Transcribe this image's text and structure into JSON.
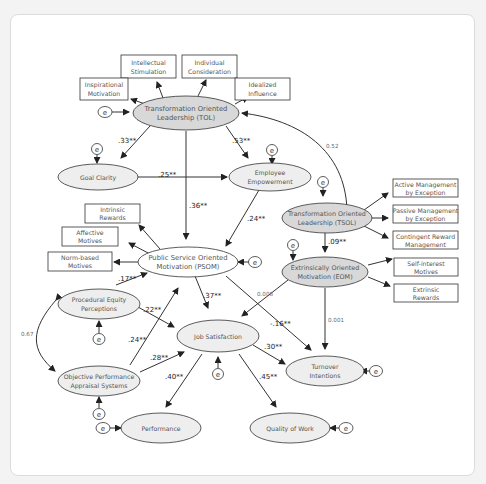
{
  "diagram": {
    "type": "structural-equation-model",
    "latent_nodes": [
      {
        "id": "TOL",
        "line1": "Transformation Oriented",
        "line2": "Leadership (TOL)",
        "shaded": true
      },
      {
        "id": "GC",
        "line1": "Goal Clarity",
        "line2": "",
        "shaded": false
      },
      {
        "id": "EE",
        "line1": "Employee",
        "line2": "Empowerment",
        "shaded": false
      },
      {
        "id": "TSOL",
        "line1": "Transformation Oriented",
        "line2": "Leadership (TSOL)",
        "shaded": true
      },
      {
        "id": "EOM",
        "line1": "Extrinsically Oriented",
        "line2": "Motivation (EOM)",
        "shaded": true
      },
      {
        "id": "PSOM",
        "line1": "Public Service Oriented",
        "line2": "Motivation (PSOM)",
        "shaded": false
      },
      {
        "id": "PEP",
        "line1": "Procedural Equity",
        "line2": "Perceptions",
        "shaded": false
      },
      {
        "id": "OPAS",
        "line1": "Objective Performance",
        "line2": "Appraisal Systems",
        "shaded": false
      },
      {
        "id": "JS",
        "line1": "Job Satisfaction",
        "line2": "",
        "shaded": false
      },
      {
        "id": "TI",
        "line1": "Turnover",
        "line2": "Intentions",
        "shaded": false
      },
      {
        "id": "PERF",
        "line1": "Performance",
        "line2": "",
        "shaded": false
      },
      {
        "id": "QW",
        "line1": "Quality of Work",
        "line2": "",
        "shaded": false
      }
    ],
    "indicators": [
      {
        "id": "intellectual",
        "line1": "Intellectual",
        "line2": "Stimulation"
      },
      {
        "id": "individual",
        "line1": "Individual",
        "line2": "Consideration"
      },
      {
        "id": "inspirational",
        "line1": "Inspirational",
        "line2": "Motivation"
      },
      {
        "id": "idealized",
        "line1": "Idealized",
        "line2": "Influence"
      },
      {
        "id": "active",
        "line1": "Active Management",
        "line2": "by Exception"
      },
      {
        "id": "passive",
        "line1": "Passive Management",
        "line2": "by Exception"
      },
      {
        "id": "contingent",
        "line1": "Contingent Reward",
        "line2": "Management"
      },
      {
        "id": "selfinterest",
        "line1": "Self-interest",
        "line2": "Motives"
      },
      {
        "id": "extrinsic",
        "line1": "Extrinsic",
        "line2": "Rewards"
      },
      {
        "id": "intrinsic",
        "line1": "Intrinsic",
        "line2": "Rewards"
      },
      {
        "id": "affective",
        "line1": "Affective",
        "line2": "Motives"
      },
      {
        "id": "normbased",
        "line1": "Norm-based",
        "line2": "Motives"
      }
    ],
    "error_label": "e",
    "paths": [
      {
        "from": "TOL",
        "to": "GC",
        "coef": ".33**"
      },
      {
        "from": "TOL",
        "to": "EE",
        "coef": ".53**"
      },
      {
        "from": "GC",
        "to": "EE",
        "coef": ".25**"
      },
      {
        "from": "TOL",
        "to": "PSOM",
        "coef": ".36**"
      },
      {
        "from": "EE",
        "to": "PSOM",
        "coef": ".24**"
      },
      {
        "from": "TSOL",
        "to": "EOM",
        "coef": ".09**"
      },
      {
        "from": "TSOL",
        "to": "TOL",
        "coef": "0.52"
      },
      {
        "from": "EOM",
        "to": "JS",
        "coef": "0.008"
      },
      {
        "from": "EOM",
        "to": "TI",
        "coef": "0.001"
      },
      {
        "from": "PEP",
        "to": "PSOM",
        "coef": ".17**"
      },
      {
        "from": "PEP",
        "to": "JS",
        "coef": ".22**"
      },
      {
        "from": "OPAS",
        "to": "PSOM",
        "coef": ".24**"
      },
      {
        "from": "OPAS",
        "to": "JS",
        "coef": ".28**"
      },
      {
        "from": "PSOM",
        "to": "JS",
        "coef": ".37**"
      },
      {
        "from": "PSOM",
        "to": "TI",
        "coef": "-.16**"
      },
      {
        "from": "JS",
        "to": "TI",
        "coef": ".30**"
      },
      {
        "from": "JS",
        "to": "PERF",
        "coef": ".40**"
      },
      {
        "from": "JS",
        "to": "QW",
        "coef": ".45**"
      },
      {
        "from": "PEP",
        "to": "OPAS",
        "coef": "0.67"
      }
    ]
  }
}
